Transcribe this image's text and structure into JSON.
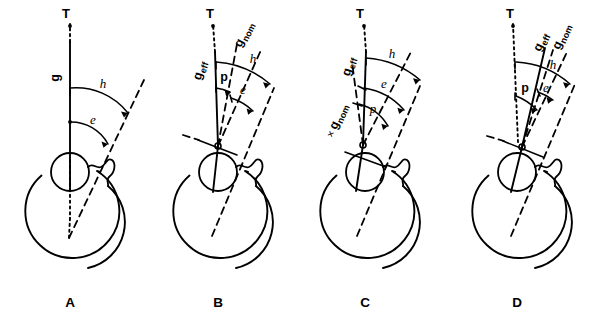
{
  "figure": {
    "background_color": "#ffffff",
    "line_color": "#000000",
    "width": 599,
    "height": 322
  },
  "panels": [
    {
      "id": "A",
      "letter": "A",
      "labels": {
        "target": "T",
        "gaze": "g",
        "angle_h": "h",
        "angle_e": "e"
      },
      "axes": [
        "g",
        "visual-axis",
        "optical-axis"
      ],
      "angles": [
        "h",
        "e"
      ]
    },
    {
      "id": "B",
      "letter": "B",
      "labels": {
        "target": "T",
        "gaze_effective": "geff",
        "gaze_effective_base": "g",
        "gaze_effective_sub": "eff",
        "gaze_nominal": "gnom",
        "gaze_nominal_base": "g",
        "gaze_nominal_sub": "nom",
        "angle_h": "h",
        "angle_e": "e",
        "angle_p": "p"
      },
      "axes": [
        "geff",
        "gnom",
        "visual-axis",
        "optical-axis"
      ],
      "angles": [
        "h",
        "e",
        "p"
      ]
    },
    {
      "id": "C",
      "letter": "C",
      "labels": {
        "target": "T",
        "gaze_effective": "geff",
        "gaze_effective_base": "g",
        "gaze_effective_sub": "eff",
        "gaze_nominal": "gnom",
        "gaze_nominal_base": "g",
        "gaze_nominal_sub": "nom",
        "gnom_marker": "×",
        "angle_h": "h",
        "angle_e": "e",
        "angle_p": "p"
      },
      "axes": [
        "geff",
        "gnom",
        "visual-axis",
        "optical-axis"
      ],
      "angles": [
        "h",
        "e",
        "p"
      ]
    },
    {
      "id": "D",
      "letter": "D",
      "labels": {
        "target": "T",
        "gaze_effective": "geff",
        "gaze_effective_base": "g",
        "gaze_effective_sub": "eff",
        "gaze_nominal": "gnom",
        "gaze_nominal_base": "g",
        "gaze_nominal_sub": "nom",
        "angle_h": "h",
        "angle_e": "e",
        "angle_p": "p"
      },
      "axes": [
        "geff",
        "gnom",
        "visual-axis",
        "optical-axis"
      ],
      "angles": [
        "h",
        "e",
        "p"
      ]
    }
  ]
}
